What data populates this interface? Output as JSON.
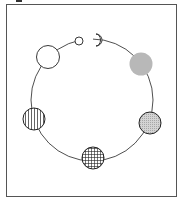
{
  "diagram": {
    "colors": {
      "stroke": "#222222",
      "frame": "#555555",
      "gray_fill": "#b8b8b8",
      "stipple_fill": "#cfcfcf",
      "background": "#ffffff"
    },
    "markers": [
      {
        "id": "small-open",
        "fill": "none",
        "shape": "circle",
        "size": "small"
      },
      {
        "id": "crescent",
        "fill": "none",
        "shape": "crescent",
        "size": "small"
      },
      {
        "id": "gray-solid",
        "fill": "gray",
        "shape": "circle",
        "size": "large"
      },
      {
        "id": "stippled",
        "fill": "stipple",
        "shape": "circle",
        "size": "large"
      },
      {
        "id": "grid-hatched",
        "fill": "grid",
        "shape": "circle",
        "size": "large"
      },
      {
        "id": "vertical-hatched",
        "fill": "vertical",
        "shape": "circle",
        "size": "large"
      },
      {
        "id": "large-open",
        "fill": "none",
        "shape": "circle",
        "size": "large"
      }
    ]
  }
}
